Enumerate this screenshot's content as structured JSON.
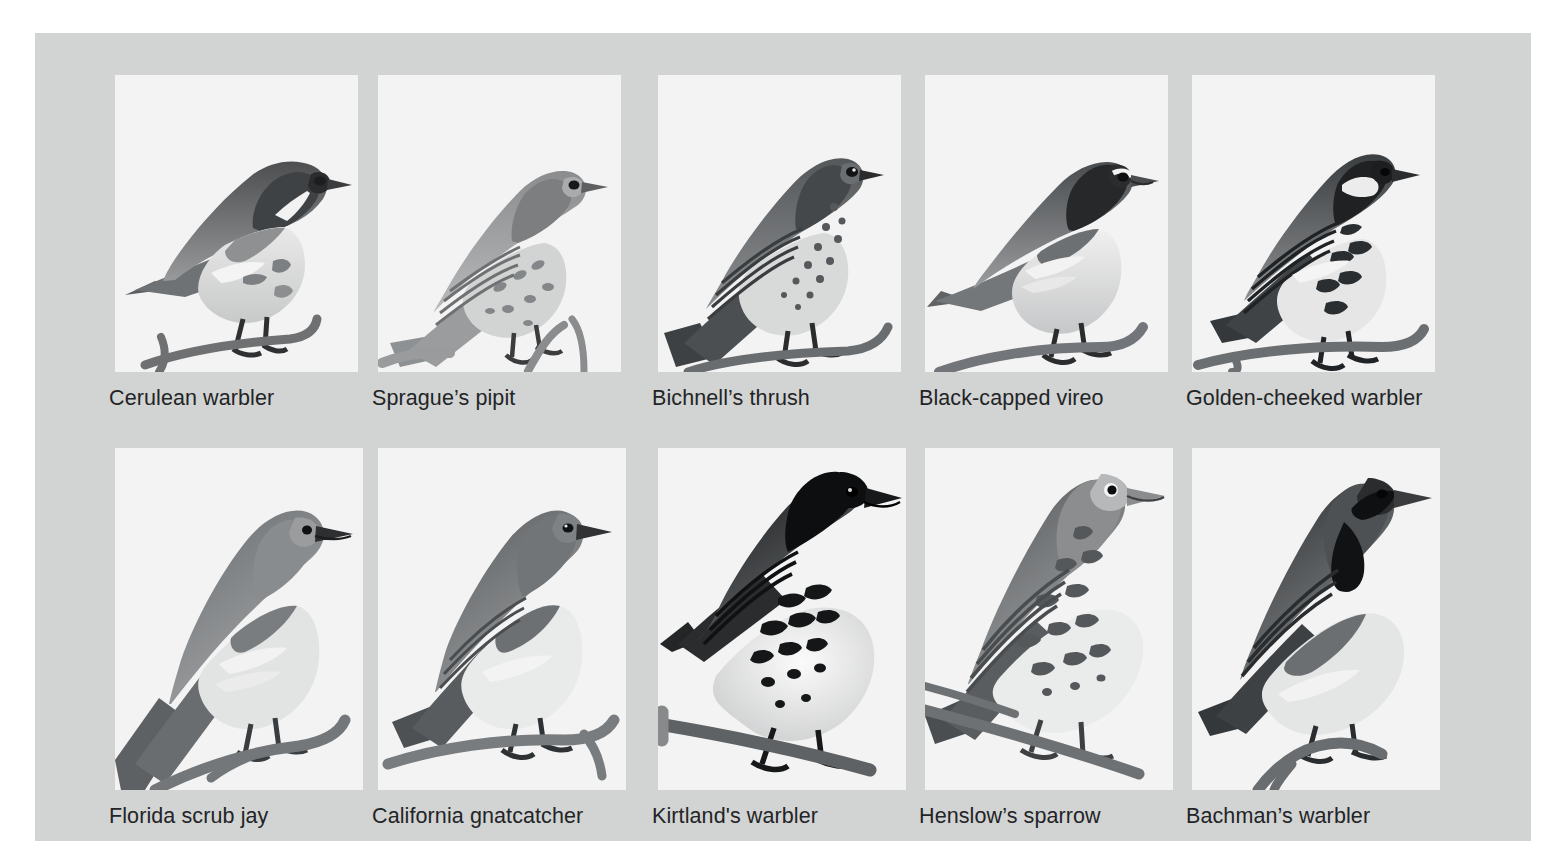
{
  "figure": {
    "background_color": "#d2d3d3",
    "tile_color": "#f3f3f3",
    "text_color": "#222426",
    "rows": 2,
    "columns": 5
  },
  "species": [
    {
      "label": "Cerulean warbler",
      "row": 0,
      "col": 0,
      "art": "perched-songbird-left-branch"
    },
    {
      "label": "Sprague’s pipit",
      "row": 0,
      "col": 1,
      "art": "perched-pipit-streaked"
    },
    {
      "label": "Bichnell’s thrush",
      "row": 0,
      "col": 2,
      "art": "perched-thrush-spotted"
    },
    {
      "label": "Black-capped vireo",
      "row": 0,
      "col": 3,
      "art": "perched-vireo-dark-cap"
    },
    {
      "label": "Golden-cheeked warbler",
      "row": 0,
      "col": 4,
      "art": "perched-warbler-striped-head"
    },
    {
      "label": "Florida scrub jay",
      "row": 1,
      "col": 0,
      "art": "perched-jay-long-tail"
    },
    {
      "label": "California gnatcatcher",
      "row": 1,
      "col": 1,
      "art": "perched-gnatcatcher-plain"
    },
    {
      "label": "Kirtland's warbler",
      "row": 1,
      "col": 2,
      "art": "perched-warbler-black-cap-spotted"
    },
    {
      "label": "Henslow’s sparrow",
      "row": 1,
      "col": 3,
      "art": "perched-sparrow-streaked"
    },
    {
      "label": "Bachman’s warbler",
      "row": 1,
      "col": 4,
      "art": "perched-warbler-dark-throat"
    }
  ]
}
